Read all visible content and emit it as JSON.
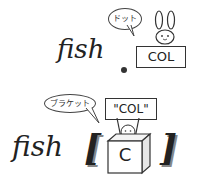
{
  "panel_top": {
    "expression_text": "fish",
    "operator": ".",
    "sign_label": "COL",
    "bubble_label": "ドット",
    "character": "rabbit-icon"
  },
  "panel_bottom": {
    "expression_text": "fish",
    "open_bracket": "[",
    "close_bracket": "]",
    "box_label": "C",
    "sign_label": "\"COL\"",
    "bubble_label": "ブラケット",
    "character": "creature-in-box-icon"
  },
  "colors": {
    "ink": "#222222",
    "shadow": "#888888",
    "bubble_fill": "#dddddd"
  }
}
